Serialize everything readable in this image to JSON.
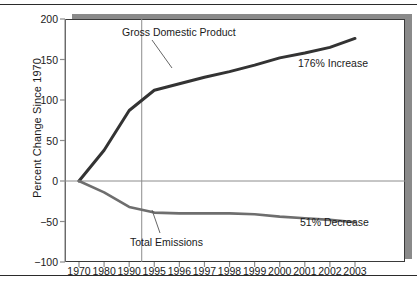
{
  "chart_data": {
    "type": "line",
    "title": "",
    "xlabel": "",
    "ylabel": "Percent Change Since 1970",
    "ylim": [
      -100,
      200
    ],
    "yticks": [
      200,
      150,
      100,
      50,
      0,
      -50,
      -100
    ],
    "ytick_labels": [
      "200",
      "150",
      "100",
      "50",
      "0",
      "−50",
      "−100"
    ],
    "categories": [
      "1970",
      "1980",
      "1990",
      "1995",
      "1996",
      "1997",
      "1998",
      "1999",
      "2000",
      "2001",
      "2002",
      "2003"
    ],
    "grid": false,
    "legend_position": "inline-annotations",
    "zero_line": 0,
    "divider_after_category": "1990",
    "series": [
      {
        "name": "Gross Domestic Product",
        "color": "#333333",
        "values": [
          0,
          38,
          87,
          112,
          120,
          128,
          135,
          143,
          152,
          158,
          165,
          176
        ],
        "end_label": "176% Increase"
      },
      {
        "name": "Total Emissions",
        "color": "#6e6e6e",
        "values": [
          0,
          -14,
          -32,
          -39,
          -40,
          -40,
          -40,
          -41,
          -44,
          -46,
          -48,
          -51
        ],
        "end_label": "51% Decrease"
      }
    ],
    "annotations": [
      {
        "text": "Gross Domestic Product",
        "series": "Gross Domestic Product"
      },
      {
        "text": "Total Emissions",
        "series": "Total Emissions"
      },
      {
        "text": "176% Increase",
        "series": "Gross Domestic Product"
      },
      {
        "text": "51% Decrease",
        "series": "Total Emissions"
      }
    ]
  },
  "colors": {
    "gdp_line": "#333333",
    "emissions_line": "#6e6e6e",
    "axis": "#8c8c8c",
    "frame": "#3a3a3a",
    "shadow": "#8a8a8a",
    "text": "#1a1a1a"
  }
}
